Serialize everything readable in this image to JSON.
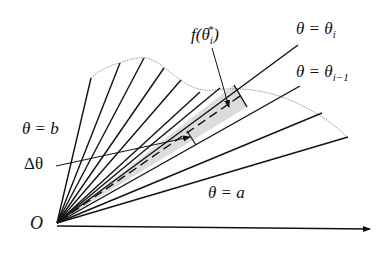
{
  "diagram": {
    "labels": {
      "origin": "O",
      "theta_b": "θ = b",
      "theta_a": "θ = a",
      "theta_i_prefix": "θ = θ",
      "theta_i_sub": "i",
      "theta_im1_prefix": "θ = θ",
      "theta_im1_sub": "i−1",
      "delta_theta": "Δθ",
      "f_prefix": "f(θ",
      "f_sub": "i",
      "f_sup": "*",
      "f_suffix": ")"
    },
    "colors": {
      "line": "#111111",
      "curve": "#999999",
      "sector_fill": "#dcdcdc",
      "background": "#ffffff"
    },
    "origin_px": [
      57,
      223
    ],
    "ray_count": 12
  }
}
